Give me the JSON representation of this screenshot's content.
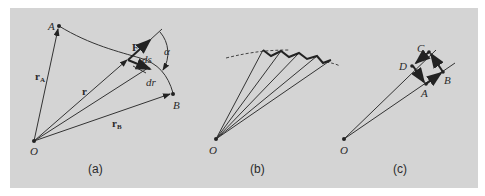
{
  "figure": {
    "background_color": "#d4d4d4",
    "ink_color": "#2a2a2a",
    "panels": [
      {
        "id": "a",
        "caption": "(a)",
        "points": {
          "origin": "O",
          "start": "A",
          "end": "B"
        },
        "vectors": {
          "rA": "r",
          "rA_sub": "A",
          "r": "r",
          "rB": "r",
          "rB_sub": "B",
          "force": "F",
          "ds": "ds",
          "dr": "dr"
        },
        "angle": "α"
      },
      {
        "id": "b",
        "caption": "(b)",
        "points": {
          "origin": "O"
        }
      },
      {
        "id": "c",
        "caption": "(c)",
        "points": {
          "origin": "O",
          "A": "A",
          "B": "B",
          "C": "C",
          "D": "D"
        }
      }
    ]
  }
}
